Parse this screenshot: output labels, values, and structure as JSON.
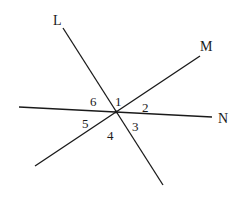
{
  "diagram": {
    "type": "intersecting-lines",
    "intersection_point": [
      116,
      112
    ],
    "lines": [
      {
        "name": "L",
        "label": "L",
        "from": [
          63,
          28
        ],
        "to": [
          163,
          185
        ],
        "label_pos": [
          53,
          25
        ]
      },
      {
        "name": "M",
        "label": "M",
        "from": [
          200,
          56
        ],
        "to": [
          35,
          166
        ],
        "label_pos": [
          200,
          51
        ]
      },
      {
        "name": "N",
        "label": "N",
        "from": [
          19,
          107
        ],
        "to": [
          212,
          117
        ],
        "label_pos": [
          218,
          123
        ]
      }
    ],
    "angles": [
      {
        "label": "1",
        "pos": [
          115,
          106
        ]
      },
      {
        "label": "2",
        "pos": [
          142,
          112
        ]
      },
      {
        "label": "3",
        "pos": [
          132,
          131
        ]
      },
      {
        "label": "4",
        "pos": [
          107,
          140
        ]
      },
      {
        "label": "5",
        "pos": [
          82,
          128
        ]
      },
      {
        "label": "6",
        "pos": [
          90,
          106
        ]
      }
    ]
  }
}
